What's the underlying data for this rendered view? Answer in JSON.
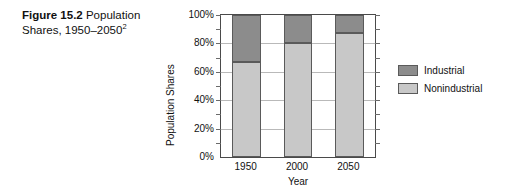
{
  "caption": {
    "figure_label": "Figure 15.2",
    "text": "Population Shares, 1950–2050",
    "footnote_marker": "2"
  },
  "legend": {
    "position": "right",
    "items": [
      {
        "label": "Industrial",
        "color": "#8c8c8c"
      },
      {
        "label": "Nonindustrial",
        "color": "#c8c8c8"
      }
    ]
  },
  "chart_data": {
    "type": "bar",
    "stacked": true,
    "title": "",
    "subtitle": "",
    "xlabel": "Year",
    "ylabel": "Population Shares",
    "categories": [
      "1950",
      "2000",
      "2050"
    ],
    "series": [
      {
        "name": "Nonindustrial",
        "color": "#c8c8c8",
        "values": [
          67,
          80,
          87
        ]
      },
      {
        "name": "Industrial",
        "color": "#8c8c8c",
        "values": [
          33,
          20,
          13
        ]
      }
    ],
    "ylim": [
      0,
      100
    ],
    "yunit": "%",
    "ytick_labels": [
      "0%",
      "20%",
      "40%",
      "60%",
      "80%",
      "100%"
    ],
    "ytick_values": [
      0,
      20,
      40,
      60,
      80,
      100
    ],
    "yminor_tick_values": [
      10,
      30,
      50,
      70,
      90
    ],
    "grid": true,
    "grid_axis": "y",
    "legend_position": "right"
  }
}
